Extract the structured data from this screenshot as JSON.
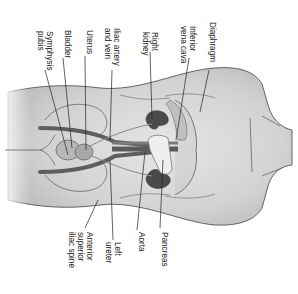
{
  "diagram": {
    "orientation": "rotated-90-clockwise",
    "colors": {
      "skin": "#d9d9d9",
      "skin_shadow": "#c4c4c4",
      "outline": "#555555",
      "kidney": "#4a4a4a",
      "vessel": "#5e5e5e",
      "leader_line": "#222222",
      "label_text": "#222222",
      "background": "#ffffff"
    },
    "labels": {
      "diaphragm": "Diaphragm",
      "inferior_vena_cava_1": "Inferior",
      "inferior_vena_cava_2": "vena cava",
      "right_kidney_1": "Right",
      "right_kidney_2": "kidney",
      "iliac_1": "Iliac artery",
      "iliac_2": "and vein",
      "uterus": "Uterus",
      "bladder": "Bladder",
      "symphysis_1": "Symphysis",
      "symphysis_2": "pubis",
      "pancreas": "Pancreas",
      "aorta": "Aorta",
      "left_ureter_1": "Left",
      "left_ureter_2": "ureter",
      "asis_1": "Anterior",
      "asis_2": "superior",
      "asis_3": "iliac spine"
    }
  }
}
